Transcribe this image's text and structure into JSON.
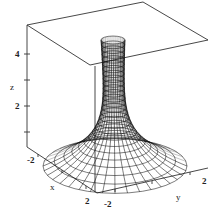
{
  "chart_data": {
    "type": "surface3d",
    "title": "",
    "xlabel": "x",
    "ylabel": "y",
    "zlabel": "z",
    "x_ticks": [
      "-2",
      "2"
    ],
    "y_ticks": [
      "-2",
      "2"
    ],
    "z_ticks": [
      "2",
      "4"
    ],
    "xlim": [
      -2,
      2
    ],
    "ylim": [
      -2,
      2
    ],
    "zlim": [
      0,
      5
    ],
    "grid": false,
    "legend": null,
    "surface": {
      "shape": "funnel",
      "center": [
        0,
        0
      ],
      "approx_profile": [
        {
          "r": 0.25,
          "z": 5.0
        },
        {
          "r": 0.35,
          "z": 4.0
        },
        {
          "r": 0.5,
          "z": 3.0
        },
        {
          "r": 0.7,
          "z": 2.0
        },
        {
          "r": 1.0,
          "z": 1.2
        },
        {
          "r": 1.5,
          "z": 0.5
        },
        {
          "r": 2.0,
          "z": 0.2
        }
      ]
    }
  },
  "axes": {
    "z_label": "z",
    "z_tick_4": "4",
    "z_tick_2": "2",
    "x_label": "x",
    "x_tick_neg": "-2",
    "x_tick_pos": "2",
    "y_label": "y",
    "y_tick_neg": "-2",
    "y_tick_pos": "2"
  }
}
